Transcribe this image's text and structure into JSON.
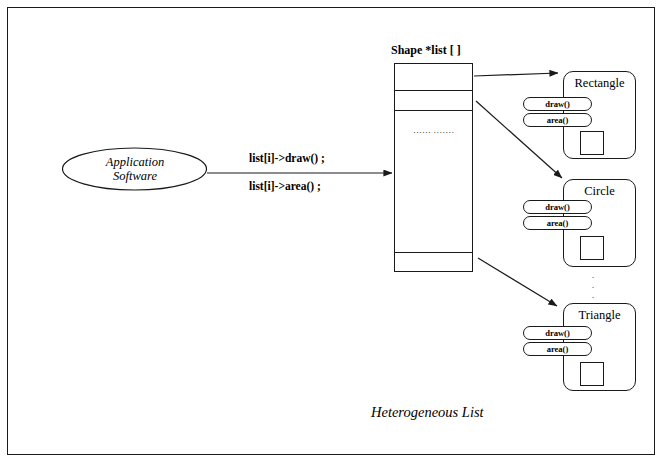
{
  "figure": {
    "caption": "Heterogeneous List",
    "border_color": "#1a1a1a",
    "background": "#ffffff"
  },
  "application": {
    "label_line1": "Application",
    "label_line2": "Software"
  },
  "calls": {
    "draw_call": "list[i]->draw() ;",
    "area_call": "list[i]->area() ;"
  },
  "list_array": {
    "header": "Shape *list [ ]",
    "ellipsis": "·\n·\n·\n·\n·\n·\n·\n·\n·\n·\n·\n·\n·",
    "cells": [
      {
        "name": "cell-0",
        "top": 0,
        "height": 27
      },
      {
        "name": "cell-1",
        "top": 27,
        "height": 20
      },
      {
        "name": "cell-middle",
        "top": 47,
        "height": 142
      },
      {
        "name": "cell-last",
        "top": 189,
        "height": 18
      }
    ]
  },
  "objects": [
    {
      "title": "Rectangle",
      "shape_icon": "square-shape-icon",
      "methods": [
        "draw()",
        "area()"
      ],
      "box": {
        "left": 563,
        "top": 71,
        "height": 88
      },
      "title_top": 76,
      "pills_top": [
        97,
        113
      ],
      "pills_left": 523,
      "shape": {
        "left": 580,
        "top": 131
      }
    },
    {
      "title": "Circle",
      "shape_icon": "square-shape-icon",
      "methods": [
        "draw()",
        "area()"
      ],
      "box": {
        "left": 563,
        "top": 179,
        "height": 88
      },
      "title_top": 184,
      "pills_top": [
        200,
        216
      ],
      "pills_left": 523,
      "shape": {
        "left": 580,
        "top": 236
      }
    },
    {
      "title": "Triangle",
      "shape_icon": "square-shape-icon",
      "methods": [
        "draw()",
        "area()"
      ],
      "box": {
        "left": 563,
        "top": 303,
        "height": 88
      },
      "title_top": 308,
      "pills_top": [
        326,
        342
      ],
      "pills_left": 523,
      "shape": {
        "left": 580,
        "top": 362
      }
    }
  ],
  "inter_object_ellipsis": [
    "·",
    "·",
    "·"
  ]
}
